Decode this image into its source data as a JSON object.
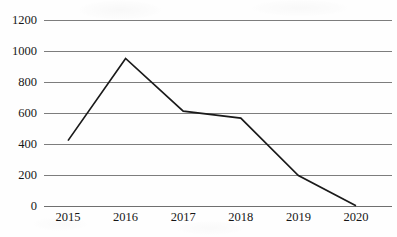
{
  "chart_data": {
    "type": "line",
    "title": "",
    "subtitle": "",
    "xlabel": "",
    "ylabel": "",
    "categories": [
      "2015",
      "2016",
      "2017",
      "2018",
      "2019",
      "2020"
    ],
    "values": [
      425,
      955,
      615,
      570,
      200,
      5
    ],
    "series": [
      {
        "name": "",
        "values": [
          425,
          955,
          615,
          570,
          200,
          5
        ]
      }
    ],
    "ylim": [
      0,
      1200
    ],
    "yticks": [
      0,
      200,
      400,
      600,
      800,
      1000,
      1200
    ],
    "ytick_labels": [
      "0",
      "200",
      "400",
      "600",
      "800",
      "1000",
      "1200"
    ],
    "xtick_labels": [
      "2015",
      "2016",
      "2017",
      "2018",
      "2019",
      "2020"
    ],
    "grid": true,
    "grid_axis": "y",
    "legend": false,
    "legend_position": "none",
    "annotations": [],
    "colors": {
      "line": "#1a1a1a",
      "grid": "#7d7d7d",
      "axis": "#6f6f6f",
      "background": "#fefefe",
      "text": "#171717"
    }
  }
}
